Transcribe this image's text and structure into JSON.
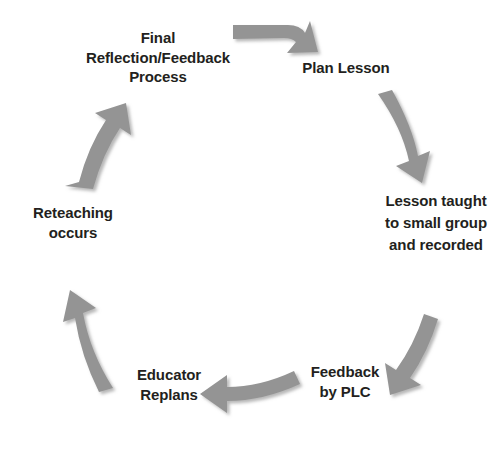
{
  "diagram": {
    "type": "cycle",
    "background_color": "#ffffff",
    "arrow_color": "#949494",
    "arrow_shadow_color": "#c9c9c9",
    "text_color": "#231f20",
    "direction": "clockwise",
    "node_count": 6,
    "nodes": [
      {
        "id": "final-reflection",
        "label": "Final\nReflection/Feedback\nProcess",
        "position": "top-left"
      },
      {
        "id": "plan-lesson",
        "label": "Plan Lesson",
        "position": "top-right"
      },
      {
        "id": "lesson-taught",
        "label": "Lesson taught\nto small group\nand recorded",
        "position": "right"
      },
      {
        "id": "feedback-plc",
        "label": "Feedback\nby PLC",
        "position": "bottom-right"
      },
      {
        "id": "educator-replans",
        "label": "Educator\nReplans",
        "position": "bottom-left"
      },
      {
        "id": "reteaching",
        "label": "Reteaching\noccurs",
        "position": "left"
      }
    ],
    "arrows": [
      {
        "id": "arrow-top",
        "from": "final-reflection",
        "to": "plan-lesson",
        "direction": "right-down"
      },
      {
        "id": "arrow-upper-right",
        "from": "plan-lesson",
        "to": "lesson-taught",
        "direction": "down"
      },
      {
        "id": "arrow-lower-right",
        "from": "lesson-taught",
        "to": "feedback-plc",
        "direction": "down-left"
      },
      {
        "id": "arrow-bottom",
        "from": "feedback-plc",
        "to": "educator-replans",
        "direction": "left"
      },
      {
        "id": "arrow-lower-left",
        "from": "educator-replans",
        "to": "reteaching",
        "direction": "up-left"
      },
      {
        "id": "arrow-upper-left",
        "from": "reteaching",
        "to": "final-reflection",
        "direction": "up-right"
      }
    ]
  }
}
